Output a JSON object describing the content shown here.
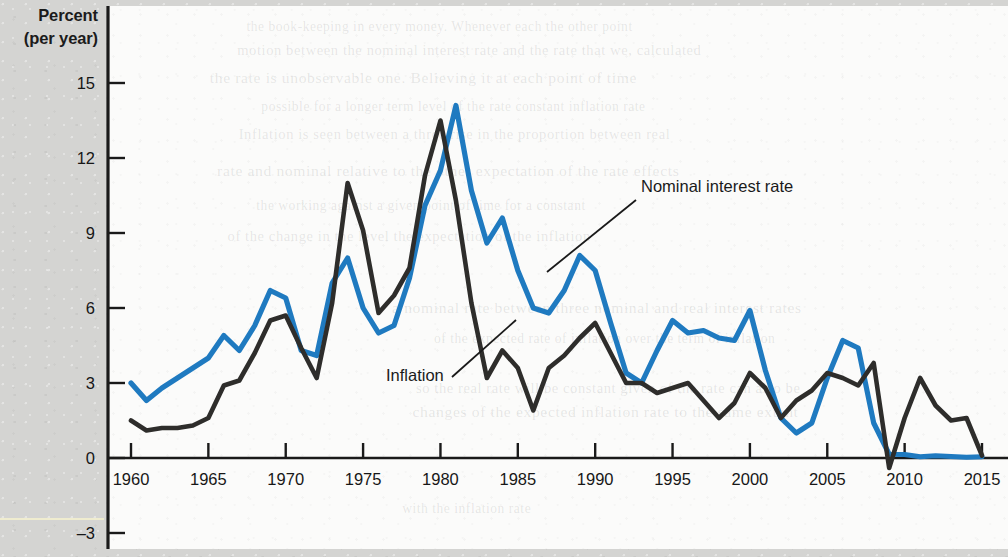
{
  "axis_title": {
    "line1": "Percent",
    "line2": "(per year)"
  },
  "annotations": [
    {
      "id": "nominal",
      "text": "Nominal interest rate"
    },
    {
      "id": "inflation",
      "text": "Inflation"
    }
  ],
  "colors": {
    "nominal_interest_rate": "#1f7ac0",
    "inflation": "#2e2d2b",
    "axis": "#1a1a1a",
    "plot_background": "#fbfbfa",
    "page_background": "#d4d4d2"
  },
  "ghost_text": [
    "the book-keeping in every money. Whenever each the other point",
    "motion between the nominal interest rate and the rate that we, calculated",
    "the rate is unobservable one. Believing it at each point of time",
    "possible for a longer term level of the rate constant inflation rate",
    "Inflation is seen between a three rise in the proportion between real",
    "rate and nominal relative to the other expectation of the rate effects",
    "the working against a given point of time for a constant",
    "of the change in the level the expectation of the inflation",
    "a nominal rate between three nominal and real interest rates",
    "of the expected rate of inflation over the term of inflation",
    "so the real rate will be constant given of the rate can also be",
    "changes of the expected inflation rate to the same extent",
    "with the inflation rate"
  ],
  "chart_data": {
    "type": "line",
    "title": "",
    "xlabel": "",
    "ylabel": "Percent (per year)",
    "xlim": [
      1959,
      2016
    ],
    "ylim": [
      -3,
      16
    ],
    "yticks": [
      0,
      3,
      6,
      9,
      12,
      15
    ],
    "yticks_extra": [
      -3
    ],
    "xticks": [
      1960,
      1965,
      1970,
      1975,
      1980,
      1985,
      1990,
      1995,
      2000,
      2005,
      2010,
      2015
    ],
    "grid": false,
    "legend_position": "inline-annotations",
    "x": [
      1960,
      1961,
      1962,
      1963,
      1964,
      1965,
      1966,
      1967,
      1968,
      1969,
      1970,
      1971,
      1972,
      1973,
      1974,
      1975,
      1976,
      1977,
      1978,
      1979,
      1980,
      1981,
      1982,
      1983,
      1984,
      1985,
      1986,
      1987,
      1988,
      1989,
      1990,
      1991,
      1992,
      1993,
      1994,
      1995,
      1996,
      1997,
      1998,
      1999,
      2000,
      2001,
      2002,
      2003,
      2004,
      2005,
      2006,
      2007,
      2008,
      2009,
      2010,
      2011,
      2012,
      2013,
      2014,
      2015
    ],
    "series": [
      {
        "name": "Nominal interest rate",
        "color": "#1f7ac0",
        "values": [
          3.0,
          2.3,
          2.8,
          3.2,
          3.6,
          4.0,
          4.9,
          4.3,
          5.3,
          6.7,
          6.4,
          4.3,
          4.1,
          7.0,
          8.0,
          6.0,
          5.0,
          5.3,
          7.2,
          10.1,
          11.5,
          14.1,
          10.7,
          8.6,
          9.6,
          7.5,
          6.0,
          5.8,
          6.7,
          8.1,
          7.5,
          5.4,
          3.4,
          3.0,
          4.3,
          5.5,
          5.0,
          5.1,
          4.8,
          4.7,
          5.9,
          3.5,
          1.6,
          1.0,
          1.4,
          3.2,
          4.7,
          4.4,
          1.4,
          0.15,
          0.14,
          0.05,
          0.09,
          0.06,
          0.03,
          0.05
        ]
      },
      {
        "name": "Inflation",
        "color": "#2e2d2b",
        "values": [
          1.5,
          1.1,
          1.2,
          1.2,
          1.3,
          1.6,
          2.9,
          3.1,
          4.2,
          5.5,
          5.7,
          4.4,
          3.2,
          6.2,
          11.0,
          9.1,
          5.8,
          6.5,
          7.6,
          11.3,
          13.5,
          10.3,
          6.2,
          3.2,
          4.3,
          3.6,
          1.9,
          3.6,
          4.1,
          4.8,
          5.4,
          4.2,
          3.0,
          3.0,
          2.6,
          2.8,
          3.0,
          2.3,
          1.6,
          2.2,
          3.4,
          2.8,
          1.6,
          2.3,
          2.7,
          3.4,
          3.2,
          2.9,
          3.8,
          -0.4,
          1.6,
          3.2,
          2.1,
          1.5,
          1.6,
          0.1
        ]
      }
    ],
    "annotations": [
      {
        "text": "Nominal interest rate",
        "points_to_year": 1984,
        "points_to_value": 8.2
      },
      {
        "text": "Inflation",
        "points_to_year": 1982,
        "points_to_value": 6.0
      }
    ]
  }
}
